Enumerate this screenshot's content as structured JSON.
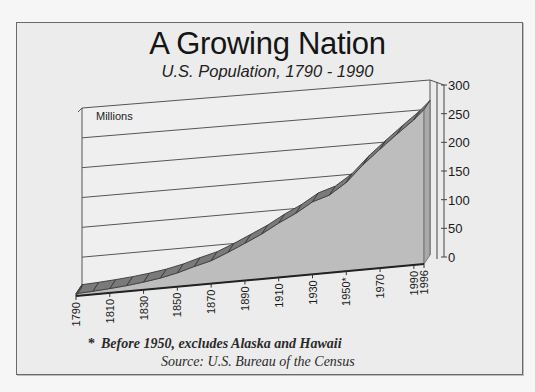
{
  "chart_data": {
    "type": "area",
    "style": "3d-ribbon",
    "title": "A Growing Nation",
    "subtitle": "U.S. Population, 1790 - 1990",
    "ylabel": "Millions",
    "xlabel": "",
    "ylim": [
      0,
      300
    ],
    "y_ticks": [
      0,
      50,
      100,
      150,
      200,
      250,
      300
    ],
    "x_tick_labels": [
      "1790",
      "1810",
      "1830",
      "1850",
      "1870",
      "1890",
      "1910",
      "1930",
      "1950*",
      "1970",
      "1990",
      "1996"
    ],
    "x": [
      1790,
      1800,
      1810,
      1820,
      1830,
      1840,
      1850,
      1860,
      1870,
      1880,
      1890,
      1900,
      1910,
      1920,
      1930,
      1940,
      1950,
      1960,
      1970,
      1980,
      1990,
      1996
    ],
    "series": [
      {
        "name": "U.S. Population (millions)",
        "values": [
          3.9,
          5.3,
          7.2,
          9.6,
          12.9,
          17.1,
          23.2,
          31.4,
          38.6,
          50.2,
          63.0,
          76.2,
          92.2,
          106.0,
          123.2,
          132.2,
          151.3,
          179.3,
          203.3,
          226.5,
          248.7,
          265.0
        ]
      }
    ],
    "grid": true,
    "legend": "none",
    "annotations": [
      "* Before 1950, excludes Alaska and Hawaii",
      "Source: U.S. Bureau of the Census"
    ]
  },
  "header": {
    "title": "A Growing Nation",
    "subtitle": "U.S. Population, 1790 - 1990"
  },
  "axis": {
    "units_label": "Millions"
  },
  "footer": {
    "footnote_marker": "*",
    "footnote": "Before 1950, excludes Alaska and Hawaii",
    "source": "Source:  U.S. Bureau of the Census"
  },
  "colors": {
    "frame_bg": "#ececec",
    "wall_bg": "#efefef",
    "area_fill": "#bdbdbd",
    "ribbon_top": "#7a7a7a",
    "grid": "#555555",
    "text": "#1a1a1a"
  }
}
